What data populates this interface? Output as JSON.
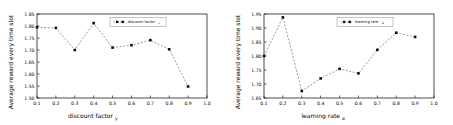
{
  "figure": {
    "panel_count": 2
  },
  "chart_data": [
    {
      "type": "line",
      "title": "",
      "xlabel": "discount factor",
      "xlabel_sub": "γ",
      "ylabel": "Average reward every time slot",
      "legend": "discount factor γ",
      "legend_label": "discount factor",
      "legend_sub": "γ",
      "legend_position": "upper center",
      "grid": false,
      "xlim": [
        0.1,
        1.0
      ],
      "ylim": [
        1.5,
        1.85
      ],
      "xticks": [
        "0.1",
        "0.2",
        "0.3",
        "0.4",
        "0.5",
        "0.6",
        "0.7",
        "0.8",
        "0.9",
        "1.0"
      ],
      "xtick_values": [
        0.1,
        0.2,
        0.3,
        0.4,
        0.5,
        0.6,
        0.7,
        0.8,
        0.9,
        1.0
      ],
      "yticks": [
        "1.50",
        "1.55",
        "1.60",
        "1.65",
        "1.70",
        "1.75",
        "1.80",
        "1.85"
      ],
      "ytick_values": [
        1.5,
        1.55,
        1.6,
        1.65,
        1.7,
        1.75,
        1.8,
        1.85
      ],
      "x": [
        0.1,
        0.2,
        0.3,
        0.4,
        0.5,
        0.6,
        0.7,
        0.8,
        0.9
      ],
      "values": [
        1.795,
        1.792,
        1.7,
        1.812,
        1.71,
        1.72,
        1.741,
        1.703,
        1.548
      ],
      "line_style": "dashed",
      "line_color": "#7a7a7a",
      "marker": "square",
      "marker_color": "#111111"
    },
    {
      "type": "line",
      "title": "",
      "xlabel": "learning rate",
      "xlabel_sub": "α",
      "ylabel": "Average reward every time slot",
      "legend": "learning rate α",
      "legend_label": "learning rate",
      "legend_sub": "α",
      "legend_position": "upper center",
      "grid": false,
      "xlim": [
        0.1,
        1.0
      ],
      "ylim": [
        1.65,
        1.95
      ],
      "xticks": [
        "0.1",
        "0.2",
        "0.3",
        "0.4",
        "0.5",
        "0.6",
        "0.7",
        "0.8",
        "0.9",
        "1.0"
      ],
      "xtick_values": [
        0.1,
        0.2,
        0.3,
        0.4,
        0.5,
        0.6,
        0.7,
        0.8,
        0.9,
        1.0
      ],
      "yticks": [
        "1.65",
        "1.70",
        "1.75",
        "1.80",
        "1.85",
        "1.90",
        "1.95"
      ],
      "ytick_values": [
        1.65,
        1.7,
        1.75,
        1.8,
        1.85,
        1.9,
        1.95
      ],
      "x": [
        0.1,
        0.2,
        0.3,
        0.4,
        0.5,
        0.6,
        0.7,
        0.8,
        0.9
      ],
      "values": [
        1.8,
        1.938,
        1.675,
        1.72,
        1.754,
        1.738,
        1.822,
        1.883,
        1.868
      ],
      "line_style": "dashed",
      "line_color": "#7a7a7a",
      "marker": "square",
      "marker_color": "#111111"
    }
  ]
}
